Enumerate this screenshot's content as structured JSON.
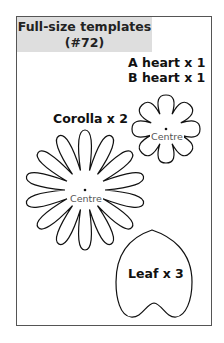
{
  "title": {
    "line1": "Full-size templates",
    "line2": "(#72)"
  },
  "labels": {
    "a_heart": "A heart x 1",
    "b_heart": "B heart x 1",
    "corolla": "Corolla x 2",
    "leaf": "Leaf x 3",
    "centre_small": "Centre",
    "centre_large": "Centre"
  },
  "shapes": {
    "small_flower": {
      "petals": 8
    },
    "large_flower": {
      "petals": 14
    },
    "leaf": {
      "shape": "heart"
    }
  }
}
